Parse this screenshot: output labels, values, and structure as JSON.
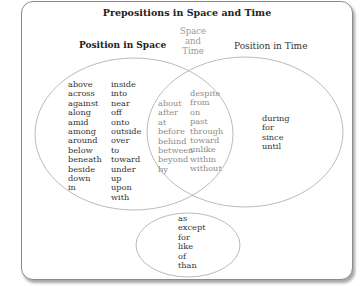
{
  "title": "Prepositions in Space and Time",
  "labels": {
    "space": "Position in Space",
    "overlap": [
      "Space",
      "and",
      "Time"
    ],
    "time": "Position in Time"
  },
  "space_only": {
    "col1": [
      "above",
      "across",
      "against",
      "along",
      "amid",
      "among",
      "around",
      "below",
      "beneath",
      "beside",
      "down",
      "in"
    ],
    "col2": [
      "inside",
      "into",
      "near",
      "off",
      "onto",
      "outside",
      "over",
      "to",
      "toward",
      "under",
      "up",
      "upon",
      "with"
    ]
  },
  "space_and_time": {
    "col1": [
      "about",
      "after",
      "at",
      "before",
      "behind",
      "between",
      "beyond",
      "by"
    ],
    "col2": [
      "despite",
      "from",
      "on",
      "past",
      "through",
      "toward",
      "unlike",
      "within",
      "without"
    ]
  },
  "time_only": [
    "during",
    "for",
    "since",
    "until"
  ],
  "other": [
    "as",
    "except",
    "for",
    "like",
    "of",
    "than"
  ],
  "colors": {
    "border": "#8a8a8a",
    "text": "#333333",
    "muted_text": "#8c8c8c",
    "ellipse_stroke": "#a0a0a0"
  }
}
